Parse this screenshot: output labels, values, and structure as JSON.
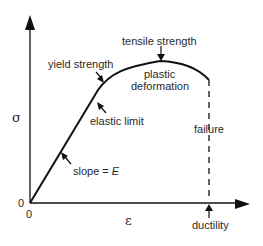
{
  "diagram": {
    "axes": {
      "y_label": "σ",
      "x_label": "ε",
      "y_origin_label": "0",
      "x_origin_label": "0"
    },
    "annotations": {
      "tensile_strength": "tensile strength",
      "yield_strength": "yield strength",
      "plastic": "plastic",
      "deformation": "deformation",
      "elastic_limit": "elastic limit",
      "failure": "failure",
      "slope_prefix": "slope = ",
      "slope_var": "E",
      "ductility": "ductility"
    },
    "colors": {
      "stroke": "#111111",
      "text": "#2a2a2a",
      "background": "#ffffff"
    }
  }
}
